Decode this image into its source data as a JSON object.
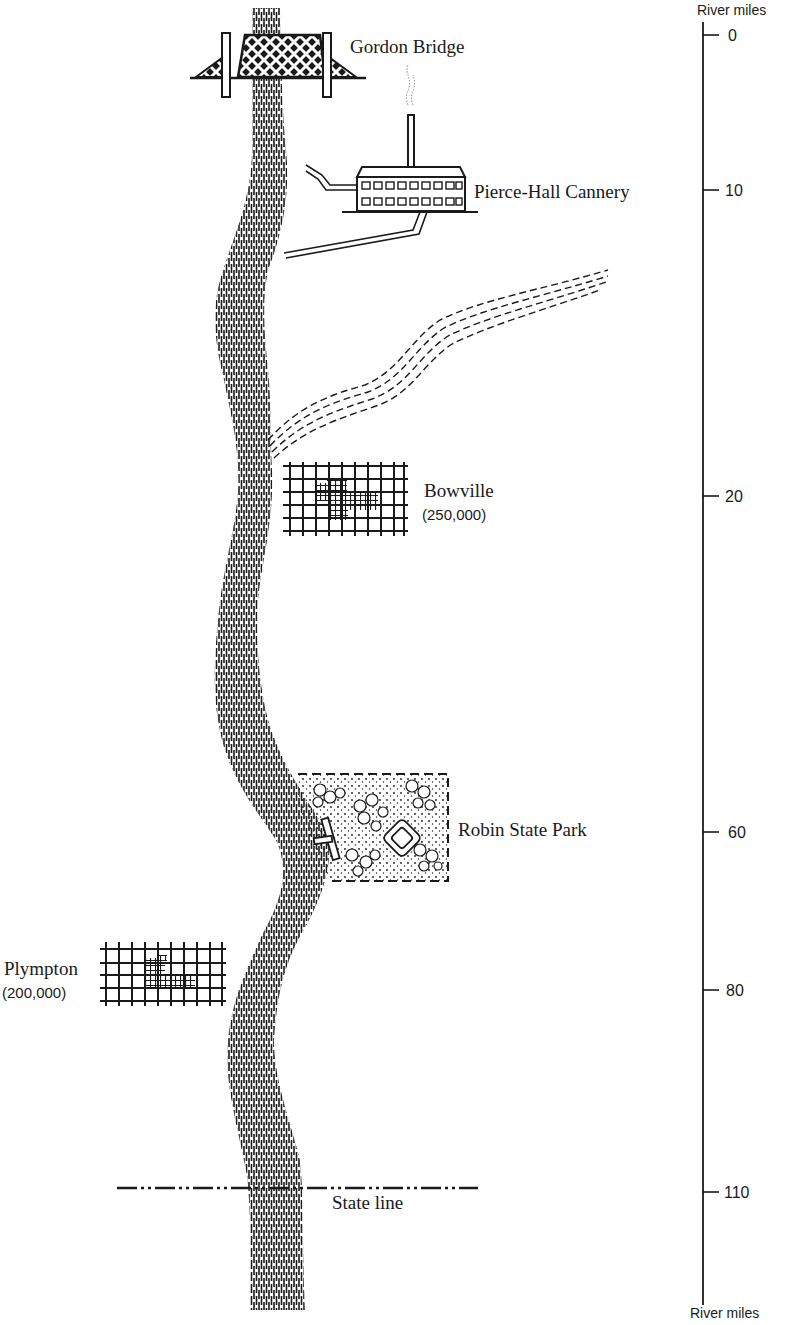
{
  "map": {
    "title": "River map with features by river mile",
    "colors": {
      "ink": "#1a1a1a",
      "paper": "#ffffff"
    },
    "features": {
      "gordon_bridge": {
        "label": "Gordon Bridge",
        "icon": "bridge-icon"
      },
      "cannery": {
        "label": "Pierce-Hall Cannery",
        "icon": "factory-icon"
      },
      "tributary": {
        "icon": "tributary-stream"
      },
      "bowville": {
        "label": "Bowville",
        "population": "(250,000)",
        "icon": "city-grid-icon"
      },
      "robin_park": {
        "label": "Robin State Park",
        "icon": "park-icon"
      },
      "plympton": {
        "label": "Plympton",
        "population": "(200,000)",
        "icon": "city-grid-icon"
      },
      "state_line": {
        "label": "State line",
        "icon": "boundary-line"
      }
    },
    "scale": {
      "title_top": "River miles",
      "title_bottom": "River miles",
      "ticks": [
        {
          "label": "0",
          "y": 35
        },
        {
          "label": "10",
          "y": 190
        },
        {
          "label": "20",
          "y": 496
        },
        {
          "label": "60",
          "y": 832
        },
        {
          "label": "80",
          "y": 990
        },
        {
          "label": "110",
          "y": 1192
        }
      ]
    }
  }
}
